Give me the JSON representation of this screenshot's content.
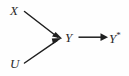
{
  "diagram": {
    "background_color": "#fefefe",
    "stroke_color": "#1f1f1f",
    "text_color": "#2b2b2b",
    "nodes": [
      {
        "id": "X",
        "label": "X",
        "x": 10,
        "y": 4
      },
      {
        "id": "U",
        "label": "U",
        "x": 10,
        "y": 57
      },
      {
        "id": "Y",
        "label": "Y",
        "x": 65,
        "y": 31
      },
      {
        "id": "Ystar",
        "label": "Y",
        "superscript": "*",
        "x": 109,
        "y": 31
      }
    ],
    "edges": [
      {
        "id": "x-to-y",
        "from": "X",
        "to": "Y",
        "style": "solid-arrow",
        "direction": "down-right"
      },
      {
        "id": "u-to-y",
        "from": "U",
        "to": "Y",
        "style": "solid-arrow",
        "direction": "up-right"
      },
      {
        "id": "y-to-ystar",
        "from": "Y",
        "to": "Ystar",
        "style": "solid-arrow",
        "direction": "right"
      }
    ]
  }
}
